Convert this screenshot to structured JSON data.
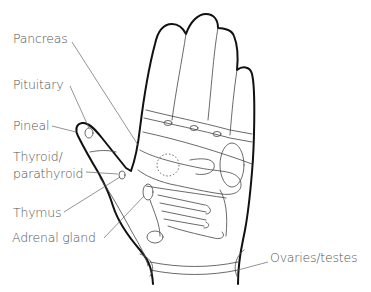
{
  "diagram": {
    "labels": [
      {
        "id": "pancreas",
        "text": "Pancreas"
      },
      {
        "id": "pituitary",
        "text": "Pituitary"
      },
      {
        "id": "pineal",
        "text": "Pineal"
      },
      {
        "id": "thyroid",
        "text": "Thyroid/"
      },
      {
        "id": "parathyroid",
        "text": "parathyroid"
      },
      {
        "id": "thymus",
        "text": "Thymus"
      },
      {
        "id": "adrenal",
        "text": "Adrenal gland"
      },
      {
        "id": "ovaries",
        "text": "Ovaries/testes"
      }
    ],
    "colors": {
      "outline": "#111111",
      "detail": "#444444",
      "label": "#555555",
      "background": "#ffffff"
    }
  }
}
